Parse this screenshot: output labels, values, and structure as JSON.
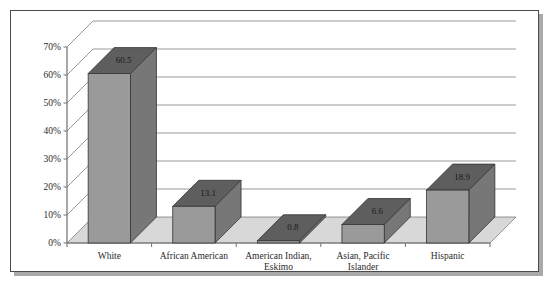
{
  "chart_data": {
    "type": "bar",
    "title": "",
    "subtitle": "",
    "xlabel": "",
    "ylabel": "",
    "categories": [
      "White",
      "African American",
      "American Indian, Eskimo",
      "Asian, Pacific Islander",
      "Hispanic"
    ],
    "category_lines": [
      [
        "White"
      ],
      [
        "African American"
      ],
      [
        "American Indian,",
        "Eskimo"
      ],
      [
        "Asian, Pacific",
        "Islander"
      ],
      [
        "Hispanic"
      ]
    ],
    "values": [
      60.5,
      13.1,
      0.8,
      6.6,
      18.9
    ],
    "value_labels": [
      "60.5",
      "13.1",
      "0.8",
      "6.6",
      "18.9"
    ],
    "ylim": [
      0,
      70
    ],
    "ytick_values": [
      0,
      10,
      20,
      30,
      40,
      50,
      60,
      70
    ],
    "ytick_labels": [
      "0%",
      "10%",
      "20%",
      "30%",
      "40%",
      "50%",
      "60%",
      "70%"
    ],
    "grid": true,
    "legend": false,
    "legend_position": "none",
    "three_d": true,
    "colors": {
      "bar_front": "#9a9a9a",
      "bar_side": "#777777",
      "bar_top": "#5e5e5e",
      "bar_outline": "#333333",
      "floor": "#d8d8d8",
      "wall": "#ffffff",
      "gridline": "#8c8c8c",
      "axis": "#6e6e6e",
      "text": "#2a2a2a",
      "frame": "#4a4a4a",
      "shadow": "#a9a9a9"
    }
  }
}
